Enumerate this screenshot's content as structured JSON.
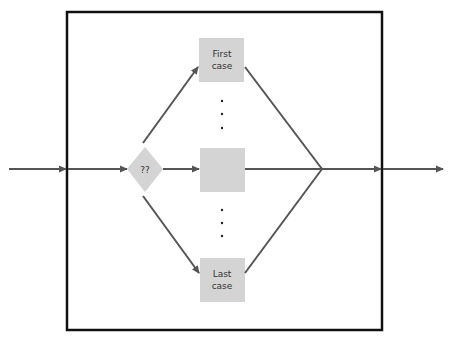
{
  "diagram": {
    "title": "",
    "colors": {
      "frame": "#111111",
      "line": "#555555",
      "box_fill": "#d4d4d4",
      "text": "#333333"
    },
    "decision": {
      "label": "??"
    },
    "cases": [
      {
        "label_line1": "First",
        "label_line2": "case"
      },
      {
        "label_line1": "",
        "label_line2": ""
      },
      {
        "label_line1": "Last",
        "label_line2": "case"
      }
    ],
    "ellipsis_glyph": "⋮"
  }
}
